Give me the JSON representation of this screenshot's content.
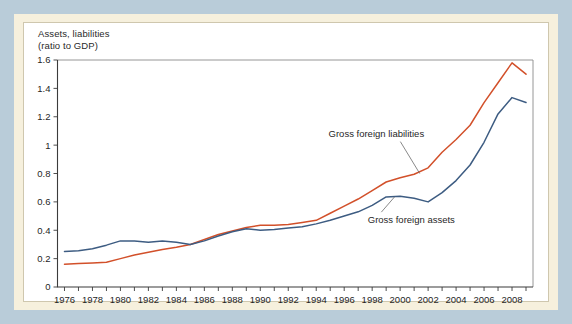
{
  "figure": {
    "background_color": "#b9ccd9",
    "frame_color": "#f6f0dd",
    "panel_color": "#ffffff"
  },
  "axis_title": "Assets, liabilities\n(ratio to GDP)",
  "chart_data": {
    "type": "line",
    "title": "Assets, liabilities (ratio to GDP)",
    "xlabel": "",
    "ylabel": "ratio to GDP",
    "grid": false,
    "legend_position": "inline-annotations",
    "xlim": [
      1975.5,
      2009.5
    ],
    "ylim": [
      0,
      1.6
    ],
    "yticks": [
      0,
      0.2,
      0.4,
      0.6,
      0.8,
      1,
      1.2,
      1.4,
      1.6
    ],
    "ytick_labels": [
      "0",
      "0.2",
      "0.4",
      "0.6",
      "0.8",
      "1",
      "1.2",
      "1.4",
      "1.6"
    ],
    "xticks": [
      1976,
      1977,
      1978,
      1979,
      1980,
      1981,
      1982,
      1983,
      1984,
      1985,
      1986,
      1987,
      1988,
      1989,
      1990,
      1991,
      1992,
      1993,
      1994,
      1995,
      1996,
      1997,
      1998,
      1999,
      2000,
      2001,
      2002,
      2003,
      2004,
      2005,
      2006,
      2007,
      2008,
      2009
    ],
    "xtick_labels_shown": [
      "1976",
      "1978",
      "1980",
      "1982",
      "1984",
      "1986",
      "1988",
      "1990",
      "1992",
      "1994",
      "1996",
      "1998",
      "2000",
      "2002",
      "2004",
      "2006",
      "2008"
    ],
    "x": [
      1976,
      1977,
      1978,
      1979,
      1980,
      1981,
      1982,
      1983,
      1984,
      1985,
      1986,
      1987,
      1988,
      1989,
      1990,
      1991,
      1992,
      1993,
      1994,
      1995,
      1996,
      1997,
      1998,
      1999,
      2000,
      2001,
      2002,
      2003,
      2004,
      2005,
      2006,
      2007,
      2008,
      2009
    ],
    "series": [
      {
        "name": "Gross foreign liabilities",
        "color": "#d2502a",
        "values": [
          0.16,
          0.165,
          0.17,
          0.175,
          0.2,
          0.225,
          0.245,
          0.265,
          0.28,
          0.3,
          0.335,
          0.37,
          0.395,
          0.42,
          0.435,
          0.435,
          0.44,
          0.455,
          0.47,
          0.52,
          0.57,
          0.62,
          0.68,
          0.74,
          0.77,
          0.795,
          0.84,
          0.95,
          1.04,
          1.14,
          1.3,
          1.44,
          1.58,
          1.5
        ],
        "annotation": {
          "text": "Gross foreign liabilities",
          "x": 1998.3,
          "y": 1.06
        }
      },
      {
        "name": "Gross foreign assets",
        "color": "#3d5c82",
        "values": [
          0.25,
          0.255,
          0.27,
          0.295,
          0.325,
          0.325,
          0.315,
          0.325,
          0.315,
          0.3,
          0.325,
          0.36,
          0.39,
          0.41,
          0.4,
          0.405,
          0.415,
          0.425,
          0.445,
          0.47,
          0.5,
          0.53,
          0.575,
          0.635,
          0.64,
          0.625,
          0.6,
          0.665,
          0.75,
          0.86,
          1.02,
          1.22,
          1.335,
          1.3
        ],
        "annotation": {
          "text": "Gross foreign assets",
          "x": 2000.8,
          "y": 0.45
        }
      }
    ]
  }
}
